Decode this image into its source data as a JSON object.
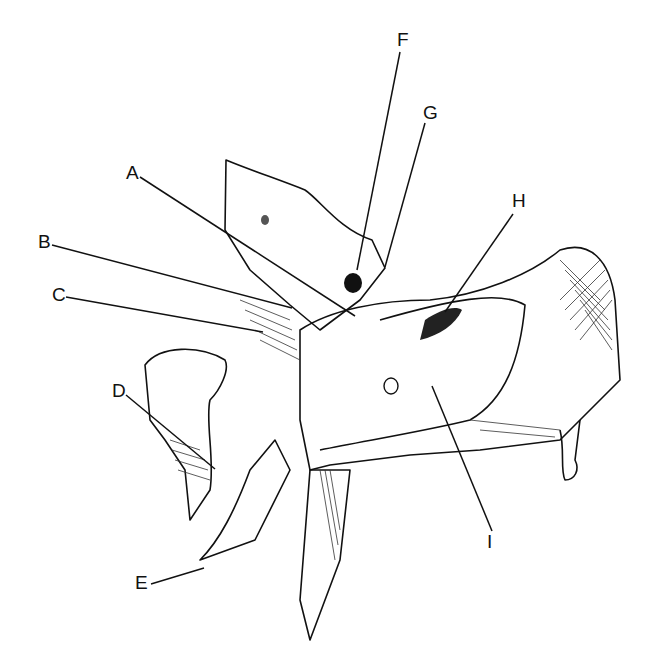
{
  "diagram": {
    "type": "anatomical-illustration",
    "labels": [
      {
        "id": "A",
        "text": "A",
        "x": 126,
        "y": 163,
        "line": [
          140,
          177,
          355,
          316
        ]
      },
      {
        "id": "B",
        "text": "B",
        "x": 38,
        "y": 232,
        "line": [
          52,
          245,
          292,
          308
        ]
      },
      {
        "id": "C",
        "text": "C",
        "x": 52,
        "y": 285,
        "line": [
          66,
          297,
          263,
          332
        ]
      },
      {
        "id": "D",
        "text": "D",
        "x": 112,
        "y": 381,
        "line": [
          126,
          395,
          215,
          469
        ]
      },
      {
        "id": "E",
        "text": "E",
        "x": 135,
        "y": 573,
        "line": [
          151,
          584,
          204,
          568
        ]
      },
      {
        "id": "F",
        "text": "F",
        "x": 397,
        "y": 30,
        "line": [
          400,
          52,
          357,
          270
        ]
      },
      {
        "id": "G",
        "text": "G",
        "x": 423,
        "y": 103,
        "line": [
          425,
          123,
          385,
          267
        ]
      },
      {
        "id": "H",
        "text": "H",
        "x": 512,
        "y": 191,
        "line": [
          513,
          214,
          445,
          312
        ]
      },
      {
        "id": "I",
        "text": "I",
        "x": 487,
        "y": 532,
        "line": [
          492,
          531,
          432,
          386
        ]
      }
    ]
  }
}
